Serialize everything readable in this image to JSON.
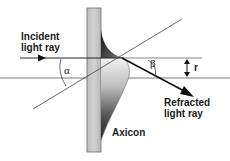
{
  "diagram": {
    "labels": {
      "incident": "Incident\nlight ray",
      "refracted": "Refracted\nlight ray",
      "axicon": "Axicon",
      "alpha": "α",
      "beta": "β",
      "r": "r"
    },
    "elements": [
      "glass-plate",
      "axicon-lens",
      "incident-ray",
      "refracted-ray",
      "optical-axis",
      "reference-line",
      "radius-dimension"
    ],
    "colors": {
      "plate": "#c8c8c8",
      "plate_edge": "#6a6a6a",
      "line": "#333333",
      "axicon_dark": "#2a2a2a",
      "axicon_light": "#f0f0f0"
    }
  }
}
